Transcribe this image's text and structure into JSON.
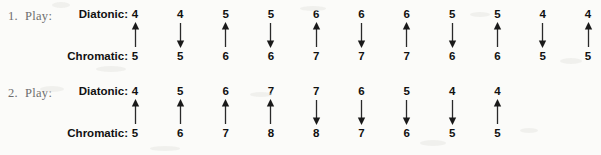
{
  "page": {
    "background_color": "#fbfbf9",
    "text_color": "#111111",
    "muted_text_color": "#6e6e6e"
  },
  "labels": {
    "diatonic": "Diatonic:",
    "chromatic": "Chromatic:",
    "play": "Play:"
  },
  "exercises": [
    {
      "number": "1.",
      "play_label": "Play:",
      "diatonic_label": "Diatonic:",
      "chromatic_label": "Chromatic:",
      "diatonic": [
        "4",
        "4",
        "5",
        "5",
        "6",
        "6",
        "6",
        "5",
        "5",
        "4",
        "4"
      ],
      "chromatic": [
        "5",
        "5",
        "6",
        "6",
        "7",
        "7",
        "7",
        "6",
        "6",
        "5",
        "5"
      ],
      "arrows": [
        "up",
        "down",
        "up",
        "down",
        "up",
        "down",
        "up",
        "down",
        "up",
        "down",
        "up"
      ]
    },
    {
      "number": "2.",
      "play_label": "Play:",
      "diatonic_label": "Diatonic:",
      "chromatic_label": "Chromatic:",
      "diatonic": [
        "4",
        "5",
        "6",
        "7",
        "7",
        "6",
        "5",
        "4",
        "4"
      ],
      "chromatic": [
        "5",
        "6",
        "7",
        "8",
        "8",
        "7",
        "6",
        "5",
        "5"
      ],
      "arrows": [
        "up",
        "up",
        "up",
        "up",
        "down",
        "down",
        "down",
        "down",
        "up"
      ]
    }
  ],
  "icons": {
    "arrow_up": "arrow-up-icon",
    "arrow_down": "arrow-down-icon"
  }
}
